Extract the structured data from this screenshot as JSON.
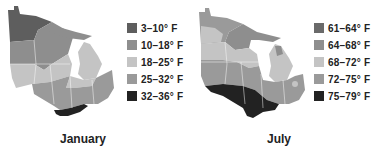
{
  "maps": [
    {
      "id": "january",
      "caption": "January",
      "legend": [
        {
          "label": "3–10° F",
          "color": "#5e5e5e"
        },
        {
          "label": "10–18° F",
          "color": "#8e8e8e"
        },
        {
          "label": "18–25° F",
          "color": "#c4c4c4"
        },
        {
          "label": "25–32° F",
          "color": "#9a9a9a"
        },
        {
          "label": "32–36° F",
          "color": "#222222"
        }
      ]
    },
    {
      "id": "july",
      "caption": "July",
      "legend": [
        {
          "label": "61–64° F",
          "color": "#6a6a6a"
        },
        {
          "label": "64–68° F",
          "color": "#8e8e8e"
        },
        {
          "label": "68–72° F",
          "color": "#c4c4c4"
        },
        {
          "label": "72–75° F",
          "color": "#9a9a9a"
        },
        {
          "label": "75–79° F",
          "color": "#222222"
        }
      ]
    }
  ]
}
